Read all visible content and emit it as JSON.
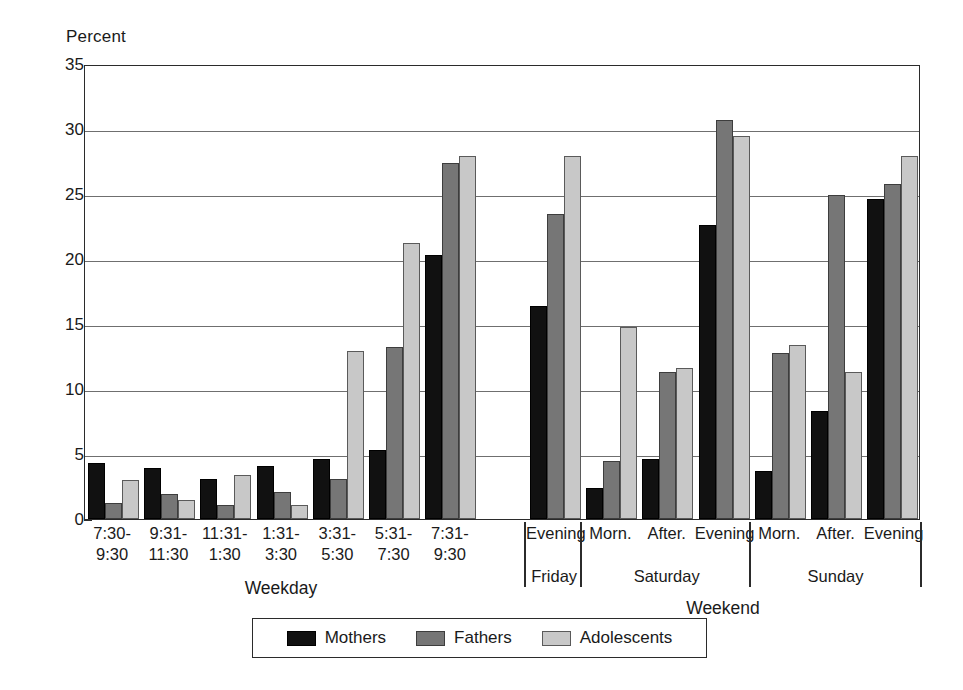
{
  "chart_data": {
    "type": "bar",
    "title": "",
    "xlabel": "",
    "ylabel": "Percent",
    "ylim": [
      0,
      35
    ],
    "yticks": [
      0,
      5,
      10,
      15,
      20,
      25,
      30,
      35
    ],
    "grid": true,
    "legend_position": "bottom",
    "legend": [
      "Mothers",
      "Fathers",
      "Adolescents"
    ],
    "categories": [
      "7:30-\n9:30",
      "9:31-\n11:30",
      "11:31-\n1:30",
      "1:31-\n3:30",
      "3:31-\n5:30",
      "5:31-\n7:30",
      "7:31-\n9:30",
      "Evening",
      "Morn.",
      "After.",
      "Evening",
      "Morn.",
      "After.",
      "Evening"
    ],
    "series": [
      {
        "name": "Mothers",
        "color": "#111111",
        "values": [
          4.3,
          3.9,
          3.1,
          4.1,
          4.6,
          5.3,
          20.3,
          16.4,
          2.4,
          4.6,
          22.6,
          3.7,
          8.3,
          24.6
        ]
      },
      {
        "name": "Fathers",
        "color": "#767676",
        "values": [
          1.2,
          1.9,
          1.1,
          2.1,
          3.1,
          13.2,
          27.4,
          23.5,
          4.5,
          11.3,
          30.7,
          12.8,
          24.9,
          25.8
        ]
      },
      {
        "name": "Adolescents",
        "color": "#c8c8c8",
        "values": [
          3.0,
          1.5,
          3.4,
          1.1,
          12.9,
          21.2,
          27.9,
          27.9,
          14.8,
          11.6,
          29.5,
          13.4,
          11.3,
          27.9
        ]
      }
    ],
    "sections": [
      {
        "label": "Weekday",
        "categories": [
          0,
          1,
          2,
          3,
          4,
          5,
          6
        ]
      },
      {
        "label": "Weekend",
        "categories": [
          7,
          8,
          9,
          10,
          11,
          12,
          13
        ]
      }
    ],
    "subgroups": [
      {
        "label": "Friday",
        "categories": [
          7
        ]
      },
      {
        "label": "Saturday",
        "categories": [
          8,
          9,
          10
        ]
      },
      {
        "label": "Sunday",
        "categories": [
          11,
          12,
          13
        ]
      }
    ]
  },
  "axis": {
    "ylabel": "Percent",
    "ytick_labels": [
      "35",
      "30",
      "25",
      "20",
      "15",
      "10",
      "5",
      "0"
    ]
  },
  "labels": {
    "cat_0_line1": "7:30-",
    "cat_0_line2": "9:30",
    "cat_1_line1": "9:31-",
    "cat_1_line2": "11:30",
    "cat_2_line1": "11:31-",
    "cat_2_line2": "1:30",
    "cat_3_line1": "1:31-",
    "cat_3_line2": "3:30",
    "cat_4_line1": "3:31-",
    "cat_4_line2": "5:30",
    "cat_5_line1": "5:31-",
    "cat_5_line2": "7:30",
    "cat_6_line1": "7:31-",
    "cat_6_line2": "9:30",
    "cat_7": "Evening",
    "cat_8": "Morn.",
    "cat_9": "After.",
    "cat_10": "Evening",
    "cat_11": "Morn.",
    "cat_12": "After.",
    "cat_13": "Evening",
    "section_weekday": "Weekday",
    "section_weekend": "Weekend",
    "subgroup_friday": "Friday",
    "subgroup_saturday": "Saturday",
    "subgroup_sunday": "Sunday"
  },
  "legend": {
    "mothers": "Mothers",
    "fathers": "Fathers",
    "adolescents": "Adolescents"
  }
}
